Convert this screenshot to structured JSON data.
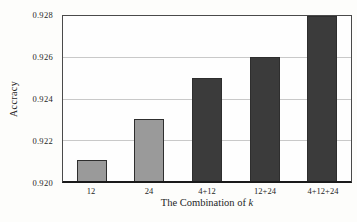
{
  "figure": {
    "ylabel": "Accracy",
    "xlabel_prefix": "The Combination of ",
    "xlabel_var": "k"
  },
  "chart_data": {
    "type": "bar",
    "title": "",
    "xlabel": "The Combination of k",
    "ylabel": "Accracy",
    "categories": [
      "12",
      "24",
      "4+12",
      "12+24",
      "4+12+24"
    ],
    "values": [
      0.921,
      0.923,
      0.925,
      0.926,
      0.928
    ],
    "ylim": [
      0.92,
      0.928
    ],
    "ytick_labels": [
      "0.920",
      "0.922",
      "0.924",
      "0.926",
      "0.928"
    ],
    "ytick_values": [
      0.92,
      0.922,
      0.924,
      0.926,
      0.928
    ],
    "gridline_values": [
      0.922,
      0.924,
      0.926
    ],
    "grid": "horizontal",
    "legend": "none",
    "bar_colors": [
      "#9a9a9a",
      "#9a9a9a",
      "#3b3b3b",
      "#3b3b3b",
      "#3b3b3b"
    ],
    "bar_border_color": "#2e2e2e"
  },
  "colors": {
    "background": "#fdfdfb",
    "frame": "#4a4a4a",
    "bottom_axis": "#1a1a1a",
    "gridline": "#c9c9c9",
    "text": "#1f1f1f"
  }
}
